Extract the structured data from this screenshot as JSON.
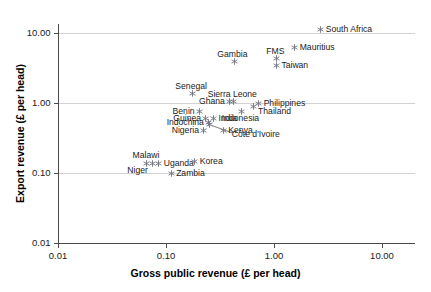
{
  "chart_data": {
    "type": "scatter",
    "title": "",
    "xlabel": "Gross public revenue (£ per head)",
    "ylabel": "Export revenue (£ per head)",
    "xscale": "log",
    "yscale": "log",
    "xlim": [
      0.01,
      20.0
    ],
    "ylim": [
      0.01,
      20.0
    ],
    "xticks": [
      "0.01",
      "0.10",
      "1.00",
      "10.00"
    ],
    "xtick_values": [
      0.01,
      0.1,
      1.0,
      10.0
    ],
    "yticks": [
      "0.01",
      "0.10",
      "1.00",
      "10.00"
    ],
    "ytick_values": [
      0.01,
      0.1,
      1.0,
      10.0
    ],
    "grid": "horizontal",
    "gridlines_at": [
      0.1,
      1.0,
      10.0
    ],
    "legend": "none",
    "marker": "small-asterisk",
    "marker_color": "#7a7a8c",
    "points": [
      {
        "name": "South Africa",
        "x": 2.7,
        "y": 11.2,
        "label_pos": "right"
      },
      {
        "name": "Mauritius",
        "x": 1.55,
        "y": 6.3,
        "label_pos": "right"
      },
      {
        "name": "FMS",
        "x": 1.05,
        "y": 4.3,
        "label_pos": "above"
      },
      {
        "name": "Taiwan",
        "x": 1.05,
        "y": 3.4,
        "label_pos": "right"
      },
      {
        "name": "Gambia",
        "x": 0.43,
        "y": 3.9,
        "label_pos": "above-left"
      },
      {
        "name": "Senegal",
        "x": 0.175,
        "y": 1.35,
        "label_pos": "above"
      },
      {
        "name": "Ghana",
        "x": 0.39,
        "y": 1.05,
        "label_pos": "left"
      },
      {
        "name": "Sierra Leone",
        "x": 0.42,
        "y": 1.05,
        "label_pos": "above"
      },
      {
        "name": "Philippines",
        "x": 0.72,
        "y": 0.97,
        "label_pos": "right"
      },
      {
        "name": "Thailand",
        "x": 0.64,
        "y": 0.88,
        "label_pos": "right-below"
      },
      {
        "name": "Indonesia",
        "x": 0.5,
        "y": 0.76,
        "label_pos": "below"
      },
      {
        "name": "Benin",
        "x": 0.205,
        "y": 0.76,
        "label_pos": "left"
      },
      {
        "name": "Guinea",
        "x": 0.235,
        "y": 0.6,
        "label_pos": "left"
      },
      {
        "name": "India",
        "x": 0.275,
        "y": 0.6,
        "label_pos": "right"
      },
      {
        "name": "Indochina",
        "x": 0.25,
        "y": 0.52,
        "label_pos": "left"
      },
      {
        "name": "Côte d'Ivoire",
        "x": 0.255,
        "y": 0.5,
        "label_pos": "leader-right"
      },
      {
        "name": "Nigeria",
        "x": 0.225,
        "y": 0.4,
        "label_pos": "left"
      },
      {
        "name": "Kenya",
        "x": 0.34,
        "y": 0.4,
        "label_pos": "right"
      },
      {
        "name": "Malawi",
        "x": 0.067,
        "y": 0.138,
        "label_pos": "above"
      },
      {
        "name": "Niger",
        "x": 0.076,
        "y": 0.138,
        "label_pos": "below-left"
      },
      {
        "name": "Uganda",
        "x": 0.086,
        "y": 0.138,
        "label_pos": "right"
      },
      {
        "name": "Korea",
        "x": 0.185,
        "y": 0.145,
        "label_pos": "right"
      },
      {
        "name": "Zambia",
        "x": 0.112,
        "y": 0.098,
        "label_pos": "right"
      }
    ]
  },
  "axes": {
    "x_title": "Gross public revenue (£ per head)",
    "y_title": "Export revenue (£ per head)"
  }
}
